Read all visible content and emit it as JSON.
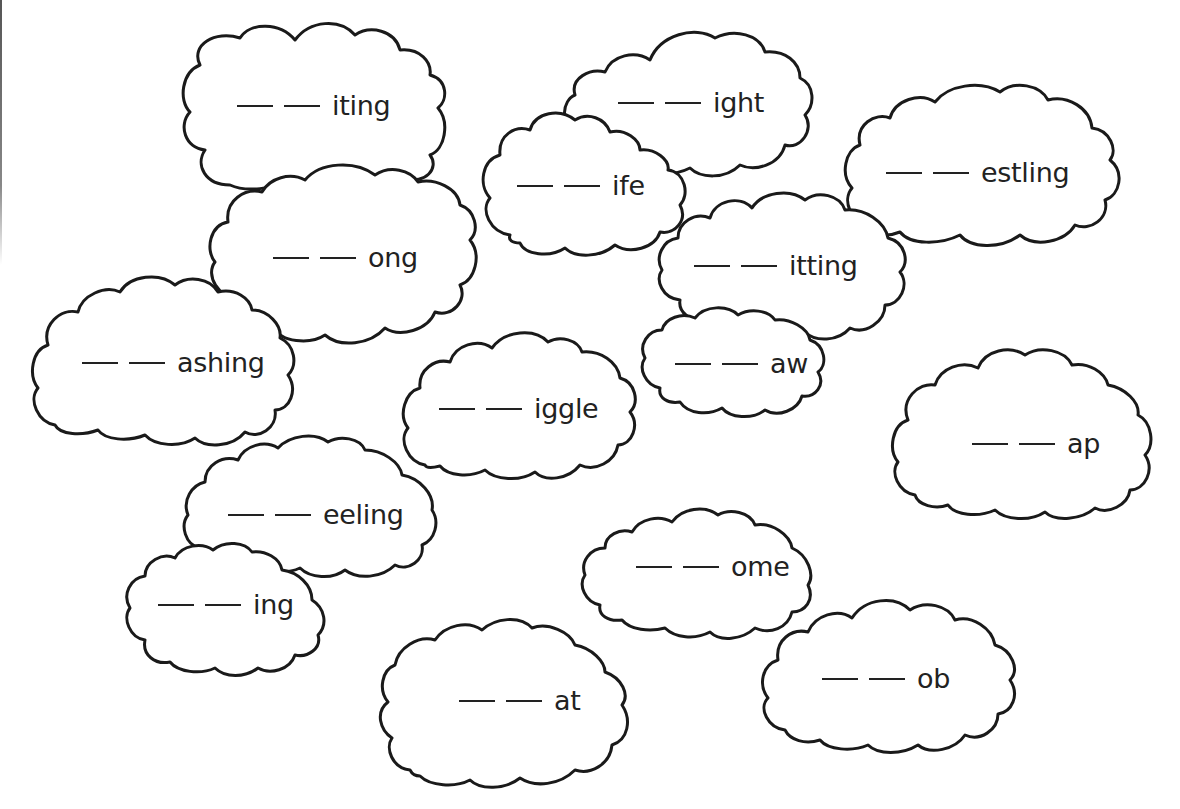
{
  "worksheet": {
    "blank_glyph": "__",
    "blanks_per_word": 2,
    "line_color": "#1a1a1a",
    "background": "#ffffff",
    "clouds": [
      {
        "id": "iting",
        "ending": "iting"
      },
      {
        "id": "ight",
        "ending": "ight"
      },
      {
        "id": "ife",
        "ending": "ife"
      },
      {
        "id": "estling",
        "ending": "estling"
      },
      {
        "id": "ong",
        "ending": "ong"
      },
      {
        "id": "itting",
        "ending": "itting"
      },
      {
        "id": "aw",
        "ending": "aw"
      },
      {
        "id": "ashing",
        "ending": "ashing"
      },
      {
        "id": "iggle",
        "ending": "iggle"
      },
      {
        "id": "ap",
        "ending": "ap"
      },
      {
        "id": "eeling",
        "ending": "eeling"
      },
      {
        "id": "ing",
        "ending": "ing"
      },
      {
        "id": "ome",
        "ending": "ome"
      },
      {
        "id": "ob",
        "ending": "ob"
      },
      {
        "id": "at",
        "ending": "at"
      }
    ]
  }
}
